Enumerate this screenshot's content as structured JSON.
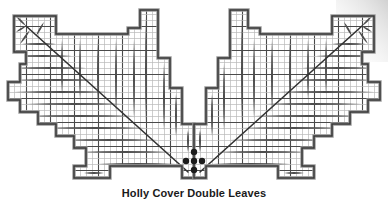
{
  "figure": {
    "title": "Holly Cover Double Leaves",
    "type": "quilting-pattern-diagram",
    "canvas": {
      "width": 388,
      "height": 205,
      "background": "#ffffff"
    },
    "colors": {
      "background": "#ffffff",
      "grid_fine": "#b9b9b9",
      "grid_major": "#4a4a4a",
      "outline": "#3a3a3a",
      "outline_shade": "#9a9a9a",
      "leaflet": "#4d4d4d",
      "stem": "#333333",
      "berry": "#1c1c1c",
      "caption_text": "#1a1a1a",
      "corner_shadow": "#d6d6d6"
    },
    "grid": {
      "cell": 6,
      "major_every": 4,
      "origin_x": 2,
      "origin_y": 2
    },
    "symmetry": "bilateral-vertical",
    "center_x": 194,
    "berries": {
      "count": 5,
      "arrangement": "quincunx",
      "radius": 3.2,
      "points": [
        {
          "x": 194,
          "y": 152
        },
        {
          "x": 186,
          "y": 161
        },
        {
          "x": 194,
          "y": 161
        },
        {
          "x": 202,
          "y": 161
        },
        {
          "x": 194,
          "y": 170
        }
      ]
    },
    "left_wing": {
      "outline": "M 14,16 L 14,52 L 26,52 L 26,64 L 20,64 L 20,82 L 8,82 L 8,100 L 20,100 L 20,112 L 38,112 L 38,124 L 56,124 L 56,136 L 74,136 L 74,148 L 86,148 L 86,166 L 74,166 L 74,178 L 110,178 L 110,166 L 182,166 L 182,178 L 194,178 L 194,124 L 182,124 L 182,88 L 170,88 L 170,58 L 158,58 L 158,10 L 140,10 L 140,28 L 128,28 L 128,34 L 56,34 L 56,16 Z",
      "stem": {
        "x1": 26,
        "y1": 26,
        "x2": 188,
        "y2": 172
      },
      "tip_leaflets": [
        {
          "x1": 26,
          "y1": 26,
          "x2": 16,
          "y2": 16
        },
        {
          "x1": 26,
          "y1": 26,
          "x2": 16,
          "y2": 32
        },
        {
          "x1": 30,
          "y1": 30,
          "x2": 20,
          "y2": 44
        },
        {
          "x1": 36,
          "y1": 36,
          "x2": 44,
          "y2": 22
        }
      ],
      "horizontal_leaflets": [
        {
          "y": 44,
          "x_out": 22,
          "x_in": 56
        },
        {
          "y": 56,
          "x_out": 14,
          "x_in": 72
        },
        {
          "y": 68,
          "x_out": 14,
          "x_in": 86
        },
        {
          "y": 80,
          "x_out": 14,
          "x_in": 98
        },
        {
          "y": 92,
          "x_out": 14,
          "x_in": 110
        },
        {
          "y": 104,
          "x_out": 26,
          "x_in": 122
        },
        {
          "y": 116,
          "x_out": 26,
          "x_in": 134
        },
        {
          "y": 128,
          "x_out": 44,
          "x_in": 146
        },
        {
          "y": 140,
          "x_out": 62,
          "x_in": 158
        },
        {
          "y": 152,
          "x_out": 80,
          "x_in": 170
        },
        {
          "y": 164,
          "x_out": 98,
          "x_in": 176
        },
        {
          "y": 173,
          "x_out": 84,
          "x_in": 104
        }
      ],
      "vertical_leaflets": [
        {
          "x": 62,
          "y_top": 40,
          "y_bot": 94
        },
        {
          "x": 80,
          "y_top": 40,
          "y_bot": 100
        },
        {
          "x": 98,
          "y_top": 40,
          "y_bot": 106
        },
        {
          "x": 116,
          "y_top": 40,
          "y_bot": 112
        },
        {
          "x": 134,
          "y_top": 40,
          "y_bot": 118
        },
        {
          "x": 146,
          "y_top": 16,
          "y_bot": 124
        },
        {
          "x": 164,
          "y_top": 64,
          "y_bot": 130
        },
        {
          "x": 176,
          "y_top": 94,
          "y_bot": 136
        },
        {
          "x": 188,
          "y_top": 130,
          "y_bot": 152
        }
      ]
    }
  },
  "caption": {
    "text": "Holly Cover Double Leaves"
  }
}
